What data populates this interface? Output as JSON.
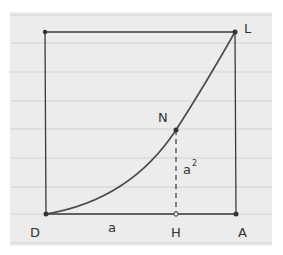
{
  "diagram": {
    "colors": {
      "paper": "#ececec",
      "ruled_line": "#d4d4d4",
      "ink": "#333333",
      "curve": "#4a4a4a"
    },
    "points": {
      "D": {
        "label": "D",
        "x": 46,
        "y": 214
      },
      "A": {
        "label": "A",
        "x": 236,
        "y": 214
      },
      "L": {
        "label": "L",
        "x": 235,
        "y": 32
      },
      "TL": {
        "label": "",
        "x": 45,
        "y": 32
      },
      "H": {
        "label": "H",
        "x": 176,
        "y": 214
      },
      "N": {
        "label": "N",
        "x": 176,
        "y": 130
      }
    },
    "labels": {
      "D": "D",
      "A": "A",
      "L": "L",
      "H": "H",
      "N": "N",
      "segment_DH": "a",
      "segment_HN": "a",
      "segment_HN_exp": "2"
    }
  }
}
